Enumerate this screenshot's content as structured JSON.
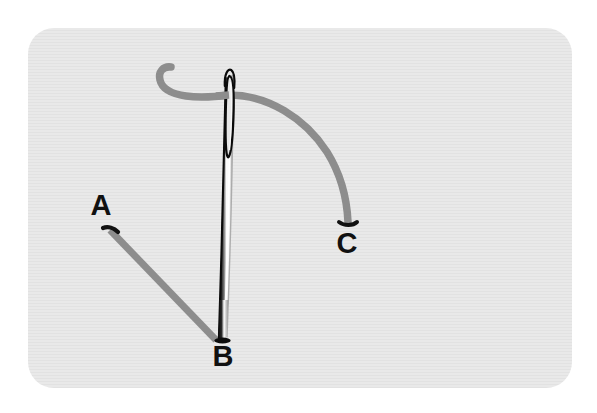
{
  "figure": {
    "panel": {
      "background_color": "#e7e7e7",
      "border_radius": 26,
      "x": 28,
      "y": 28,
      "width": 544,
      "height": 360,
      "texture": "horizontal-scanlines"
    },
    "canvas": {
      "width": 597,
      "height": 413,
      "background_color": "#ffffff"
    }
  },
  "labels": [
    {
      "id": "A",
      "text": "A",
      "x": 101,
      "y": 215,
      "font_size": 29,
      "color": "#111111",
      "description": "free thread tail end, upper left"
    },
    {
      "id": "B",
      "text": "B",
      "x": 223,
      "y": 362,
      "font_size": 29,
      "color": "#111111",
      "description": "needle point at entry site"
    },
    {
      "id": "C",
      "text": "C",
      "x": 344,
      "y": 251,
      "font_size": 29,
      "color": "#111111",
      "description": "thread end at lower right of arc"
    }
  ],
  "needle": {
    "name": "sewing-needle",
    "color_shaft_dark": "#0d0d0d",
    "color_shaft_light": "#ffffff",
    "color_shaft_mid": "#9a9a9a",
    "tip_y": 341,
    "top_y": 70,
    "eye": {
      "shape": "elongated-oval",
      "top_y": 73,
      "bottom_y": 160,
      "outline_color": "#000000",
      "fill_color": "#ededed"
    }
  },
  "thread": {
    "name": "suture-thread",
    "color": "#8d8d8d",
    "width": 7,
    "segments": [
      {
        "id": "thread-hook-left",
        "description": "hooked free end curving left of the needle eye"
      },
      {
        "id": "thread-to-A",
        "description": "straight thread running from needle point B up-left to tail A"
      },
      {
        "id": "thread-arc-to-C",
        "description": "thread arcing from the needle eye down to the right ending at C"
      }
    ],
    "end_caps": {
      "color": "#111111",
      "at": [
        "A",
        "C"
      ]
    }
  }
}
